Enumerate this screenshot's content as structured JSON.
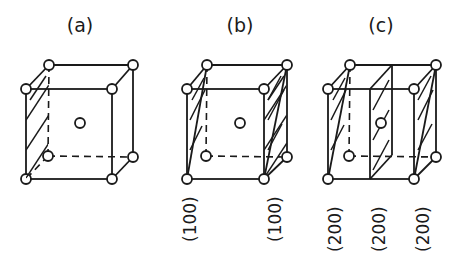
{
  "figure": {
    "panels": [
      {
        "id": "a",
        "title": "(a)",
        "plane_labels": []
      },
      {
        "id": "b",
        "title": "(b)",
        "plane_labels": [
          "(100)",
          "(100)"
        ]
      },
      {
        "id": "c",
        "title": "(c)",
        "plane_labels": [
          "(200)",
          "(200)",
          "(200)"
        ]
      }
    ]
  }
}
